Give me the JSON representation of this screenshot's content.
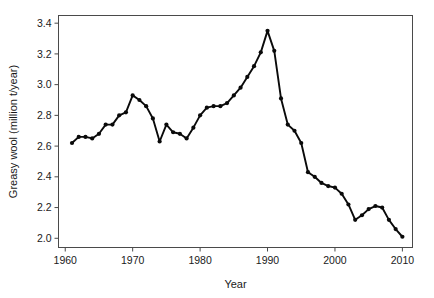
{
  "chart_data": {
    "type": "line",
    "title": "",
    "subtitle": "",
    "xlabel": "Year",
    "ylabel": "Greasy wool (million t/year)",
    "xlim": [
      1959,
      2011.5
    ],
    "ylim": [
      1.94,
      3.45
    ],
    "xticks": [
      1960,
      1970,
      1980,
      1990,
      2000,
      2010
    ],
    "xtick_labels": [
      "1960",
      "1970",
      "1980",
      "1990",
      "2000",
      "2010"
    ],
    "yticks": [
      2.0,
      2.2,
      2.4,
      2.6,
      2.8,
      3.0,
      3.2,
      3.4
    ],
    "ytick_labels": [
      "2.0",
      "2.2",
      "2.4",
      "2.6",
      "2.8",
      "3.0",
      "3.2",
      "3.4"
    ],
    "grid": false,
    "legend": null,
    "legend_position": "none",
    "marker": "filled-circle",
    "line_color": "#0a0a0a",
    "marker_color": "#0a0a0a",
    "axis_color": "#4a4a4a",
    "background_color": "#ffffff",
    "x": [
      1961,
      1962,
      1963,
      1964,
      1965,
      1966,
      1967,
      1968,
      1969,
      1970,
      1971,
      1972,
      1973,
      1974,
      1975,
      1976,
      1977,
      1978,
      1979,
      1980,
      1981,
      1982,
      1983,
      1984,
      1985,
      1986,
      1987,
      1988,
      1989,
      1990,
      1991,
      1992,
      1993,
      1994,
      1995,
      1996,
      1997,
      1998,
      1999,
      2000,
      2001,
      2002,
      2003,
      2004,
      2005,
      2006,
      2007,
      2008,
      2009,
      2010
    ],
    "values": [
      2.62,
      2.66,
      2.66,
      2.65,
      2.68,
      2.74,
      2.74,
      2.8,
      2.82,
      2.93,
      2.9,
      2.86,
      2.78,
      2.63,
      2.74,
      2.69,
      2.68,
      2.65,
      2.72,
      2.8,
      2.85,
      2.86,
      2.86,
      2.88,
      2.93,
      2.98,
      3.05,
      3.12,
      3.21,
      3.35,
      3.22,
      2.91,
      2.74,
      2.7,
      2.62,
      2.43,
      2.4,
      2.36,
      2.34,
      2.33,
      2.29,
      2.22,
      2.12,
      2.15,
      2.19,
      2.21,
      2.2,
      2.12,
      2.06,
      2.01
    ],
    "series": [
      {
        "name": "Greasy wool production",
        "values": [
          2.62,
          2.66,
          2.66,
          2.65,
          2.68,
          2.74,
          2.74,
          2.8,
          2.82,
          2.93,
          2.9,
          2.86,
          2.78,
          2.63,
          2.74,
          2.69,
          2.68,
          2.65,
          2.72,
          2.8,
          2.85,
          2.86,
          2.86,
          2.88,
          2.93,
          2.98,
          3.05,
          3.12,
          3.21,
          3.35,
          3.22,
          2.91,
          2.74,
          2.7,
          2.62,
          2.43,
          2.4,
          2.36,
          2.34,
          2.33,
          2.29,
          2.22,
          2.12,
          2.15,
          2.19,
          2.21,
          2.2,
          2.12,
          2.06,
          2.01
        ]
      }
    ]
  }
}
